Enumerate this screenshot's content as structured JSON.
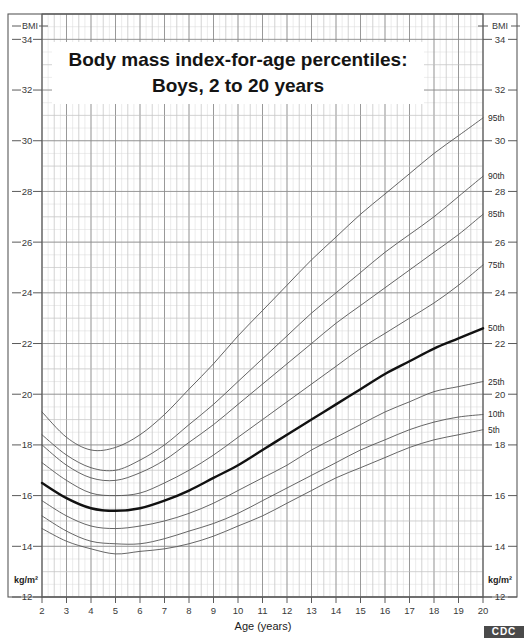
{
  "document": {
    "title_line1": "Body mass index-for-age percentiles:",
    "title_line2": "Boys, 2 to 20 years",
    "source_logo": "CDC"
  },
  "axes": {
    "y_header_left": "BMI",
    "y_header_right": "BMI",
    "y_unit_left": "kg/m²",
    "y_unit_right": "kg/m²",
    "x_title": "Age (years)",
    "y_ticks": [
      12,
      14,
      16,
      18,
      20,
      22,
      24,
      26,
      28,
      30,
      32,
      34
    ],
    "x_ticks": [
      2,
      3,
      4,
      5,
      6,
      7,
      8,
      9,
      10,
      11,
      12,
      13,
      14,
      15,
      16,
      17,
      18,
      19,
      20
    ]
  },
  "chart_data": {
    "type": "line",
    "title": "Body mass index-for-age percentiles: Boys, 2 to 20 years",
    "xlabel": "Age (years)",
    "ylabel": "BMI",
    "yunit": "kg/m²",
    "xlim": [
      2,
      20
    ],
    "ylim": [
      12,
      35
    ],
    "grid": true,
    "legend": "inline-right-labels",
    "x": [
      2,
      3,
      4,
      5,
      6,
      7,
      8,
      9,
      10,
      11,
      12,
      13,
      14,
      15,
      16,
      17,
      18,
      19,
      20
    ],
    "series": [
      {
        "name": "95th",
        "label": "95th",
        "color": "#555555",
        "width": 0.9,
        "values": [
          19.3,
          18.3,
          17.8,
          17.9,
          18.4,
          19.2,
          20.2,
          21.2,
          22.3,
          23.3,
          24.3,
          25.3,
          26.2,
          27.1,
          27.9,
          28.7,
          29.5,
          30.2,
          30.9
        ]
      },
      {
        "name": "90th",
        "label": "90th",
        "color": "#555555",
        "width": 0.9,
        "values": [
          18.4,
          17.6,
          17.1,
          17.0,
          17.4,
          18.0,
          18.8,
          19.6,
          20.5,
          21.4,
          22.3,
          23.2,
          24.0,
          24.8,
          25.6,
          26.3,
          27.0,
          27.8,
          28.6
        ]
      },
      {
        "name": "85th",
        "label": "85th",
        "color": "#555555",
        "width": 0.9,
        "values": [
          18.0,
          17.2,
          16.7,
          16.6,
          16.9,
          17.4,
          18.1,
          18.8,
          19.6,
          20.4,
          21.2,
          22.0,
          22.8,
          23.5,
          24.2,
          24.9,
          25.6,
          26.3,
          27.1
        ]
      },
      {
        "name": "75th",
        "label": "75th",
        "color": "#555555",
        "width": 0.9,
        "values": [
          17.3,
          16.6,
          16.1,
          16.0,
          16.1,
          16.5,
          17.0,
          17.6,
          18.3,
          19.0,
          19.7,
          20.4,
          21.1,
          21.8,
          22.4,
          23.0,
          23.6,
          24.3,
          25.1
        ]
      },
      {
        "name": "50th",
        "label": "50th",
        "color": "#111111",
        "width": 2.4,
        "values": [
          16.5,
          15.9,
          15.5,
          15.4,
          15.5,
          15.8,
          16.2,
          16.7,
          17.2,
          17.8,
          18.4,
          19.0,
          19.6,
          20.2,
          20.8,
          21.3,
          21.8,
          22.2,
          22.6
        ]
      },
      {
        "name": "25th",
        "label": "25th",
        "color": "#555555",
        "width": 0.9,
        "values": [
          15.8,
          15.2,
          14.8,
          14.7,
          14.8,
          15.0,
          15.3,
          15.7,
          16.2,
          16.7,
          17.2,
          17.8,
          18.3,
          18.8,
          19.3,
          19.7,
          20.1,
          20.3,
          20.5
        ]
      },
      {
        "name": "10th",
        "label": "10th",
        "color": "#555555",
        "width": 0.9,
        "values": [
          15.2,
          14.6,
          14.2,
          14.1,
          14.1,
          14.3,
          14.6,
          14.9,
          15.3,
          15.8,
          16.3,
          16.8,
          17.3,
          17.8,
          18.2,
          18.6,
          18.9,
          19.1,
          19.2
        ]
      },
      {
        "name": "5th",
        "label": "5th",
        "color": "#555555",
        "width": 0.9,
        "values": [
          14.7,
          14.2,
          13.9,
          13.7,
          13.8,
          13.9,
          14.1,
          14.4,
          14.8,
          15.2,
          15.7,
          16.2,
          16.7,
          17.1,
          17.5,
          17.9,
          18.2,
          18.4,
          18.6
        ]
      }
    ]
  }
}
